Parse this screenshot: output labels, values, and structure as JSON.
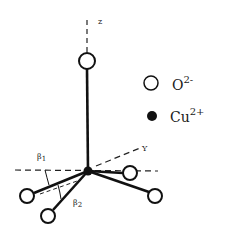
{
  "diagram": {
    "title": "",
    "axes": {
      "z_label": "z",
      "y_label": "Y"
    },
    "angles": {
      "beta1_label": "β",
      "beta1_sub": "1",
      "beta2_label": "β",
      "beta2_sub": "2"
    },
    "legend": [
      {
        "symbol": "open-circle",
        "base": "O",
        "charge": "2-"
      },
      {
        "symbol": "filled-circle",
        "base": "Cu",
        "charge": "2+"
      }
    ],
    "colors": {
      "ink": "#111111",
      "background": "#ffffff"
    }
  }
}
